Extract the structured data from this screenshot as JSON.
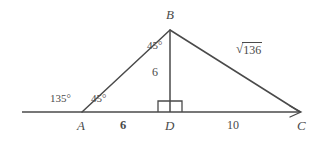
{
  "figure": {
    "kind": "geometry-diagram",
    "background_color": "#ffffff",
    "stroke_color": "#4a4a4a"
  },
  "vertices": {
    "B": "B",
    "A": "A",
    "D": "D",
    "C": "C"
  },
  "measures": {
    "segment_AD": "6",
    "segment_DC": "10",
    "altitude_BD": "6"
  },
  "angles": {
    "exterior_at_A": "135°",
    "interior_at_A": "45°",
    "at_B_left_of_altitude": "45°",
    "right_angle_at_D": "90°"
  },
  "hypotenuse": {
    "radical_sign": "√",
    "radicand": "136",
    "full": "√136"
  },
  "geometry": {
    "baseline_left_x": 22,
    "baseline_y": 112,
    "point_A_x": 82,
    "point_D_x": 170,
    "point_C_x": 300,
    "apex_B_x": 170,
    "apex_B_y": 30
  }
}
